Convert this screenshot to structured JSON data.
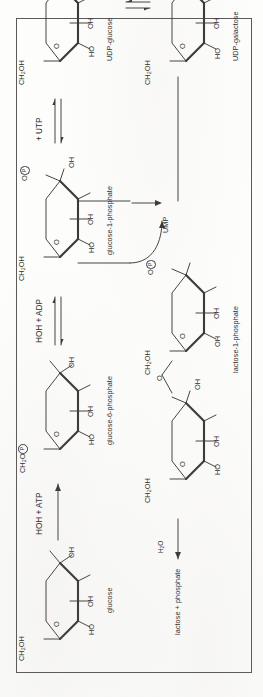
{
  "figure": {
    "type": "biochemical-pathway-diagram",
    "orientation": "rotated-90-ccw"
  },
  "molecules": {
    "glucose": {
      "name": "glucose",
      "ring_labels": [
        "CH2OH",
        "O",
        "OH",
        "OH",
        "HO",
        "H"
      ],
      "ch2oh": "CH",
      "ch2oh_sub": "2",
      "ch2oh_tail": "OH",
      "o_ring": "O",
      "oh_right": "OH",
      "oh_mid": "OH",
      "ho_bottom": "HO",
      "h_top": "H"
    },
    "glucose_6_phosphate": {
      "name": "glucose-6-phosphate",
      "ch2o": "CH",
      "ch2o_sub": "2",
      "ch2o_tail": "O",
      "phosphate_glyph": "P",
      "o_ring": "O",
      "oh_right": "OH",
      "oh_mid": "OH",
      "ho_bottom": "HO",
      "h_top": "H"
    },
    "glucose_1_phosphate": {
      "name": "glucose-1-phosphate",
      "ch2oh": "CH",
      "ch2oh_sub": "2",
      "ch2oh_tail": "OH",
      "o_ring": "O",
      "o_phos": "O",
      "phosphate_glyph": "P",
      "oh_right": "OH",
      "oh_mid": "OH",
      "ho_bottom": "HO"
    },
    "udp_glucose": {
      "name": "UDP-glucose",
      "ch2oh": "CH",
      "ch2oh_sub": "2",
      "ch2oh_tail": "OH",
      "o_ring": "O",
      "o_link1": "O",
      "o_link2": "O",
      "phosphate_glyph": "P",
      "tail": "ribose-uracil + PP",
      "oh_right": "OH",
      "oh_mid": "OH",
      "ho_bottom": "HO"
    },
    "udp_galactose": {
      "name": "UDP-galactose",
      "ch2oh": "CH",
      "ch2oh_sub": "2",
      "ch2oh_tail": "OH",
      "o_ring": "O",
      "o_link1": "O",
      "o_link2": "O",
      "phosphate_glyph": "P",
      "tail": "ribose-uracil",
      "oh_right": "OH",
      "oh_mid": "OH",
      "ho_bottom": "HO"
    },
    "lactose_1_phosphate": {
      "name": "lactose-1-phosphate",
      "galactose_unit": {
        "oh_top": "OH",
        "oh_mid": "OH",
        "o_ring": "O",
        "ch2oh": "CH",
        "ch2oh_sub": "2",
        "ch2oh_tail": "OH",
        "o_phos": "O",
        "phosphate_glyph": "P"
      },
      "glucose_unit": {
        "ch2oh": "CH",
        "ch2oh_sub": "2",
        "ch2oh_tail": "OH",
        "o_ring": "O",
        "oh_right": "OH",
        "oh_mid": "OH",
        "ho_bottom": "HO"
      },
      "glycosidic_o": "O"
    }
  },
  "reactions": {
    "glucose_to_g6p": {
      "reagents": "HOH + ATP",
      "arrow": "single-right"
    },
    "g6p_to_g1p": {
      "reagents": "HOH + ADP",
      "arrow": "equilibrium"
    },
    "g1p_to_udpglucose": {
      "reagents": "+ UTP",
      "arrow": "equilibrium"
    },
    "udpglucose_to_udpgalactose": {
      "reagents": "",
      "arrow": "equilibrium"
    },
    "udpgal_plus_g1p_to_lactose1p": {
      "byproduct": "UMP",
      "arrow": "branch-to-product"
    },
    "lactose1p_hydrolysis": {
      "reagent": "H",
      "reagent_sub": "2",
      "reagent_tail": "O",
      "product": "lactose + phosphate",
      "arrow": "single-left"
    }
  },
  "labels": {
    "glucose": "glucose",
    "glucose_6_phosphate": "glucose-6-phosphate",
    "glucose_1_phosphate": "glucose-1-phosphate",
    "udp_glucose": "UDP-glucose",
    "udp_galactose": "UDP-galactose",
    "lactose_1_phosphate": "lactose-1-phosphate",
    "lactose_phosphate": "lactose + phosphate",
    "ump": "UMP",
    "hoh_atp": "HOH + ATP",
    "hoh_adp": "HOH + ADP",
    "utp": "+ UTP"
  },
  "colors": {
    "ink": "#3a3a3a",
    "text": "#2f2f2f",
    "frame": "#5a5a5a",
    "paper": "#fdfdfc"
  }
}
